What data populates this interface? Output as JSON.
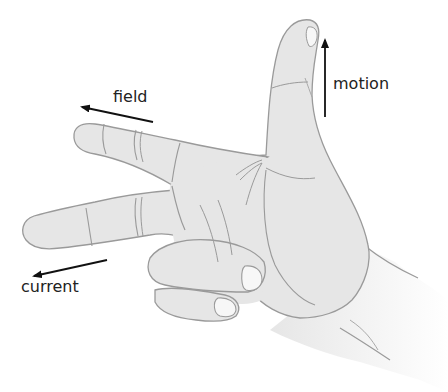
{
  "diagram": {
    "labels": {
      "field": "field",
      "motion": "motion",
      "current": "current"
    },
    "arrows": [
      {
        "name": "field",
        "direction": "left",
        "from": [
          153,
          122
        ],
        "to": [
          82,
          107
        ]
      },
      {
        "name": "motion",
        "direction": "up",
        "from": [
          325,
          117
        ],
        "to": [
          325,
          40
        ]
      },
      {
        "name": "current",
        "direction": "left",
        "from": [
          107,
          260
        ],
        "to": [
          34,
          276
        ]
      }
    ],
    "colors": {
      "skin_fill": "#e6e6e6",
      "outline": "#9a9a9a",
      "arrow": "#111111",
      "text": "#222222",
      "nail": "#f7f7f7"
    }
  }
}
